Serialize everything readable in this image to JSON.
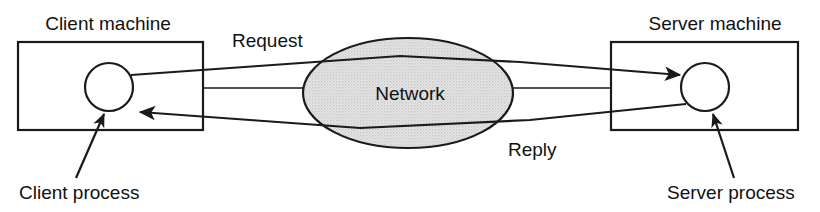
{
  "diagram": {
    "labels": {
      "client_machine": "Client machine",
      "server_machine": "Server machine",
      "network": "Network",
      "request": "Request",
      "reply": "Reply",
      "client_process": "Client process",
      "server_process": "Server process"
    },
    "nodes": [
      {
        "id": "client-machine",
        "kind": "rectangle",
        "label": "Client machine",
        "x": 18,
        "y": 42,
        "width": 185,
        "height": 88
      },
      {
        "id": "client-process",
        "kind": "circle",
        "label": "Client process",
        "cx": 109,
        "cy": 87,
        "r": 24
      },
      {
        "id": "network",
        "kind": "ellipse",
        "label": "Network",
        "cx": 408,
        "cy": 93,
        "rx": 105,
        "ry": 55
      },
      {
        "id": "server-machine",
        "kind": "rectangle",
        "label": "Server machine",
        "x": 611,
        "y": 42,
        "width": 187,
        "height": 88
      },
      {
        "id": "server-process",
        "kind": "circle",
        "label": "Server process",
        "cx": 705,
        "cy": 87,
        "r": 24
      }
    ],
    "edges": [
      {
        "id": "request-arrow",
        "label": "Request",
        "from": "client-process",
        "to": "server-process",
        "direction": "client-to-server",
        "arrowhead": true
      },
      {
        "id": "reply-arrow",
        "label": "Reply",
        "from": "server-process",
        "to": "client-process",
        "direction": "server-to-client",
        "arrowhead": true
      },
      {
        "id": "client-network-link",
        "label": "",
        "from": "client-machine",
        "to": "network",
        "arrowhead": false
      },
      {
        "id": "network-server-link",
        "label": "",
        "from": "network",
        "to": "server-machine",
        "arrowhead": false
      }
    ],
    "callouts": [
      {
        "id": "client-process-callout",
        "label": "Client process",
        "target": "client-process",
        "arrowhead": true
      },
      {
        "id": "server-process-callout",
        "label": "Server process",
        "target": "server-process",
        "arrowhead": true
      }
    ],
    "colors": {
      "stroke": "#1a1a1a",
      "text": "#111111",
      "network_fill": "#e3e3e3",
      "background": "#ffffff"
    }
  }
}
